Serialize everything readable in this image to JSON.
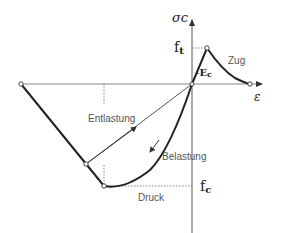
{
  "diagram": {
    "axes": {
      "y_label": "σc",
      "x_label": "ε"
    },
    "labels": {
      "ft": "f",
      "ft_sub": "t",
      "fc": "f",
      "fc_sub": "c",
      "ec": "E",
      "ec_sub": "c",
      "zug": "Zug",
      "druck": "Druck",
      "entlastung": "Entlastung",
      "belastung": "Belastung"
    },
    "colors": {
      "curve": "#222222",
      "thin_line": "#777777",
      "dotted": "#888888",
      "text": "#555555"
    }
  }
}
